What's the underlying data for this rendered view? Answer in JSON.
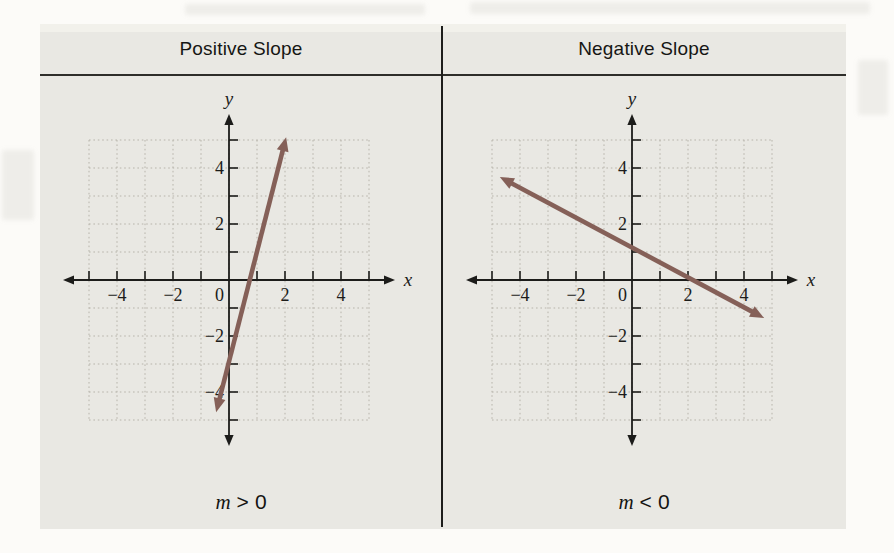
{
  "page": {
    "background": "#fcfbf8"
  },
  "figure": {
    "panel_bg": "#e9e8e3",
    "line_color": "#856058",
    "axis_color": "#1c1c1a",
    "grid_color": "#b7b4ab",
    "divider_color": "#1e1e1c",
    "panels": [
      {
        "title": "Positive Slope",
        "caption": {
          "var": "m",
          "rel": ">",
          "value": "0"
        },
        "graph": {
          "x_label": "x",
          "y_label": "y",
          "x_range": [
            -5,
            5
          ],
          "y_range": [
            -5,
            5
          ],
          "tick_labels": [
            {
              "v": -4,
              "t": "−4"
            },
            {
              "v": -2,
              "t": "−2"
            },
            {
              "v": 0,
              "t": "0"
            },
            {
              "v": 2,
              "t": "2"
            },
            {
              "v": 4,
              "t": "4"
            }
          ],
          "line": {
            "x1": -0.46,
            "y1": -4.72,
            "x2": 2.04,
            "y2": 5.1
          }
        }
      },
      {
        "title": "Negative Slope",
        "caption": {
          "var": "m",
          "rel": "<",
          "value": "0"
        },
        "graph": {
          "x_label": "x",
          "y_label": "y",
          "x_range": [
            -5,
            5
          ],
          "y_range": [
            -5,
            5
          ],
          "tick_labels": [
            {
              "v": -4,
              "t": "−4"
            },
            {
              "v": -2,
              "t": "−2"
            },
            {
              "v": 0,
              "t": "0"
            },
            {
              "v": 2,
              "t": "2"
            },
            {
              "v": 4,
              "t": "4"
            }
          ],
          "line": {
            "x1": -4.72,
            "y1": 3.68,
            "x2": 4.72,
            "y2": -1.36
          }
        }
      }
    ]
  },
  "chart_data": [
    {
      "type": "line",
      "title": "Positive Slope",
      "xlabel": "x",
      "ylabel": "y",
      "xlim": [
        -5,
        5
      ],
      "ylim": [
        -5,
        5
      ],
      "xticks": [
        -4,
        -2,
        0,
        2,
        4
      ],
      "yticks": [
        -4,
        -2,
        0,
        2,
        4
      ],
      "grid": true,
      "series": [
        {
          "name": "line with positive slope",
          "points": [
            [
              -0.46,
              -4.72
            ],
            [
              2.04,
              5.1
            ]
          ],
          "slope_sign": "positive",
          "approx_slope": 4
        }
      ],
      "annotation": "m > 0"
    },
    {
      "type": "line",
      "title": "Negative Slope",
      "xlabel": "x",
      "ylabel": "y",
      "xlim": [
        -5,
        5
      ],
      "ylim": [
        -5,
        5
      ],
      "xticks": [
        -4,
        -2,
        0,
        2,
        4
      ],
      "yticks": [
        -4,
        -2,
        0,
        2,
        4
      ],
      "grid": true,
      "series": [
        {
          "name": "line with negative slope",
          "points": [
            [
              -4.72,
              3.68
            ],
            [
              4.72,
              -1.36
            ]
          ],
          "slope_sign": "negative",
          "approx_slope": -0.5
        }
      ],
      "annotation": "m < 0"
    }
  ]
}
